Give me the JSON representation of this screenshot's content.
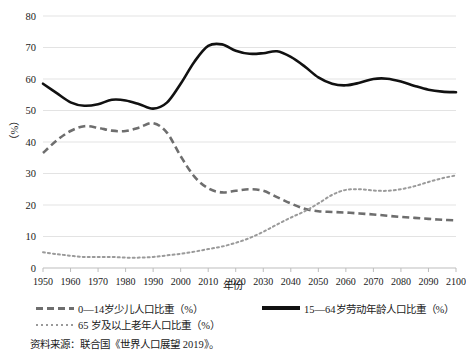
{
  "chart_data": {
    "type": "line",
    "title": "",
    "xlabel": "年份",
    "ylabel": "（%）",
    "xlim": [
      1950,
      2100
    ],
    "ylim": [
      0,
      80
    ],
    "ytick_step": 10,
    "grid": "horizontal",
    "legend_position": "bottom",
    "x": [
      1950,
      1955,
      1960,
      1965,
      1970,
      1975,
      1980,
      1985,
      1990,
      1995,
      2000,
      2005,
      2010,
      2015,
      2020,
      2025,
      2030,
      2035,
      2040,
      2045,
      2050,
      2055,
      2060,
      2065,
      2070,
      2075,
      2080,
      2085,
      2090,
      2095,
      2100
    ],
    "xticks": [
      "1950",
      "1960",
      "1970",
      "1980",
      "1990",
      "2000",
      "2010",
      "2020",
      "2030",
      "2040",
      "2050",
      "2060",
      "2070",
      "2080",
      "2090",
      "2100"
    ],
    "yticks": [
      "0",
      "10",
      "20",
      "30",
      "40",
      "50",
      "60",
      "70",
      "80"
    ],
    "series": [
      {
        "name": "0—14岁少儿人口比重（%）",
        "style": "dashed",
        "color": "#6e6e6e",
        "values": [
          36.5,
          40.5,
          43.5,
          45.0,
          44.5,
          43.6,
          43.5,
          44.6,
          46.0,
          43.0,
          35.5,
          29.0,
          25.3,
          24.0,
          24.5,
          25.0,
          24.5,
          22.5,
          20.5,
          18.8,
          18.0,
          17.8,
          17.6,
          17.3,
          17.0,
          16.6,
          16.2,
          15.9,
          15.6,
          15.3,
          15.1
        ]
      },
      {
        "name": "15—64岁劳动年龄人口比重（%）",
        "style": "solid",
        "color": "#111111",
        "values": [
          58.5,
          55.5,
          52.6,
          51.5,
          52.0,
          53.4,
          53.2,
          52.0,
          50.6,
          52.5,
          58.5,
          65.5,
          70.5,
          71.0,
          69.0,
          68.0,
          68.2,
          68.8,
          67.0,
          64.0,
          60.5,
          58.5,
          58.0,
          58.8,
          60.0,
          60.1,
          59.2,
          57.8,
          56.6,
          56.0,
          55.8
        ]
      },
      {
        "name": "65 岁及以上老年人口比重（%）",
        "style": "dotted",
        "color": "#9a9a9a",
        "values": [
          5.0,
          4.4,
          3.9,
          3.5,
          3.5,
          3.5,
          3.3,
          3.3,
          3.5,
          4.0,
          4.5,
          5.2,
          6.0,
          6.8,
          8.0,
          9.5,
          11.5,
          13.8,
          16.0,
          18.0,
          20.5,
          23.2,
          24.8,
          25.0,
          24.6,
          24.5,
          25.0,
          26.0,
          27.3,
          28.5,
          29.4
        ]
      }
    ]
  },
  "legend": {
    "items": [
      {
        "label": "0—14岁少儿人口比重（%）",
        "key": "dashed-line-key"
      },
      {
        "label": "15—64岁劳动年龄人口比重（%）",
        "key": "solid-line-key"
      },
      {
        "label": "65 岁及以上老年人口比重（%）",
        "key": "dotted-line-key"
      }
    ]
  },
  "axes": {
    "x_title": "年份",
    "y_title": "（%）"
  },
  "source_note": "资料来源：联合国《世界人口展望 2019》。",
  "colors": {
    "children_line": "#6e6e6e",
    "working_line": "#111111",
    "elderly_line": "#9a9a9a",
    "gridline": "#e3e3e3",
    "axis": "#bdbdbd",
    "text": "#1a1a1a"
  }
}
